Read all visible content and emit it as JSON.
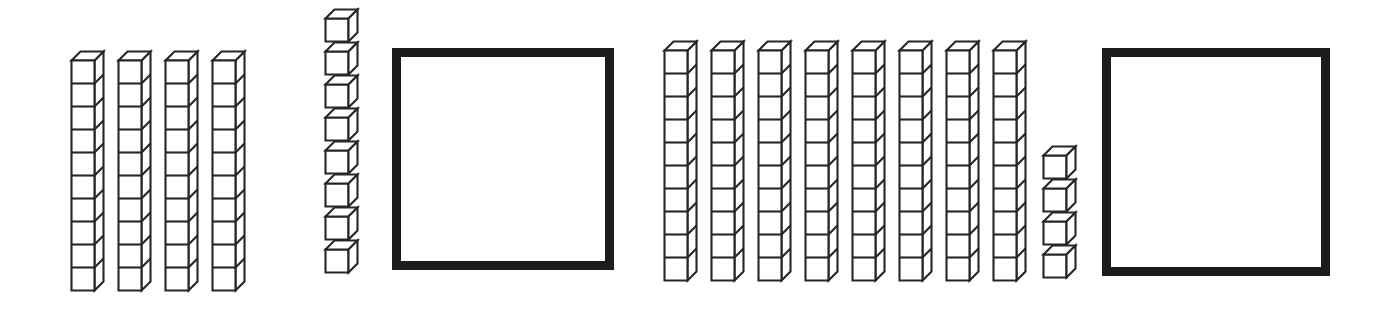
{
  "page": {
    "background_color": "#ffffff",
    "ink_color": "#262626",
    "box_border_color": "#1c1c1c",
    "width": 1384,
    "height": 315
  },
  "manipulative": {
    "type": "base-ten-blocks",
    "cube_face_size": 23,
    "cube_depth_offset": 9,
    "rod_cube_count": 10
  },
  "groups": [
    {
      "id": "left-group",
      "label": "left number model",
      "tens_rods": 4,
      "rod_cubes_each": 10,
      "unit_cubes": 8,
      "tens_value": 40,
      "ones_value": 8,
      "total_value": 48,
      "answer_box": {
        "label": "answer box",
        "value": "",
        "filled": false
      },
      "layout": {
        "rods_start_x": 70,
        "rods_top_y": 50,
        "rod_spacing_x": 47,
        "units_x": 324,
        "units_top_y": 8,
        "unit_spacing_y": 33,
        "box_x": 392,
        "box_y": 48,
        "box_size": 222
      }
    },
    {
      "id": "right-group",
      "label": "right number model",
      "tens_rods": 8,
      "rod_cubes_each": 10,
      "unit_cubes": 4,
      "tens_value": 80,
      "ones_value": 4,
      "total_value": 84,
      "answer_box": {
        "label": "answer box",
        "value": "",
        "filled": false
      },
      "layout": {
        "rods_start_x": 663,
        "rods_top_y": 40,
        "rod_spacing_x": 47,
        "units_x": 1042,
        "units_top_y": 145,
        "unit_spacing_y": 33,
        "box_x": 1102,
        "box_y": 48,
        "box_size": 228
      }
    }
  ]
}
